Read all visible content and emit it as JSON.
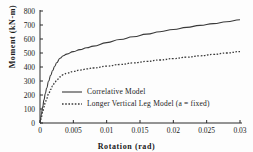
{
  "chart_data": {
    "type": "line",
    "title": "",
    "xlabel": "Rotation (rad)",
    "ylabel": "Moment (kN-m)",
    "xlim": [
      0,
      0.03
    ],
    "ylim": [
      0,
      800
    ],
    "grid": false,
    "legend_position": "center",
    "xticks": [
      "0",
      "0.005",
      "0.01",
      "0.015",
      "0.02",
      "0.025",
      "0.03"
    ],
    "xtick_values": [
      0,
      0.005,
      0.01,
      0.015,
      0.02,
      0.025,
      0.03
    ],
    "yticks": [
      "0",
      "100",
      "200",
      "300",
      "400",
      "500",
      "600",
      "700",
      "800"
    ],
    "ytick_values": [
      0,
      100,
      200,
      300,
      400,
      500,
      600,
      700,
      800
    ],
    "series": [
      {
        "name": "Correlative Model",
        "style": "solid",
        "color": "#3a3a3a",
        "x": [
          0,
          0.0002,
          0.0004,
          0.0006,
          0.0008,
          0.001,
          0.0013,
          0.0016,
          0.0019,
          0.0022,
          0.0025,
          0.003,
          0.0035,
          0.004,
          0.005,
          0.006,
          0.007,
          0.008,
          0.01,
          0.012,
          0.014,
          0.016,
          0.018,
          0.02,
          0.022,
          0.024,
          0.026,
          0.028,
          0.03
        ],
        "y": [
          0,
          60,
          115,
          165,
          210,
          250,
          300,
          340,
          375,
          405,
          430,
          462,
          480,
          492,
          510,
          524,
          537,
          549,
          574,
          596,
          616,
          635,
          652,
          668,
          683,
          697,
          710,
          723,
          737
        ]
      },
      {
        "name": "Longer Vertical Leg Model (a = fixed)",
        "style": "dotted",
        "color": "#3a3a3a",
        "x": [
          0,
          0.0002,
          0.0004,
          0.0006,
          0.0008,
          0.001,
          0.0013,
          0.0016,
          0.0019,
          0.0022,
          0.0025,
          0.003,
          0.0035,
          0.004,
          0.005,
          0.006,
          0.007,
          0.008,
          0.01,
          0.012,
          0.014,
          0.016,
          0.018,
          0.02,
          0.022,
          0.024,
          0.026,
          0.028,
          0.03
        ],
        "y": [
          0,
          42,
          80,
          115,
          147,
          175,
          210,
          240,
          265,
          287,
          305,
          330,
          345,
          355,
          368,
          378,
          386,
          393,
          406,
          418,
          429,
          440,
          450,
          460,
          470,
          480,
          490,
          500,
          510
        ]
      }
    ],
    "legend": [
      {
        "label": "Correlative Model",
        "style": "solid"
      },
      {
        "label": "Longer Vertical Leg Model (a = fixed)",
        "style": "dotted"
      }
    ]
  }
}
